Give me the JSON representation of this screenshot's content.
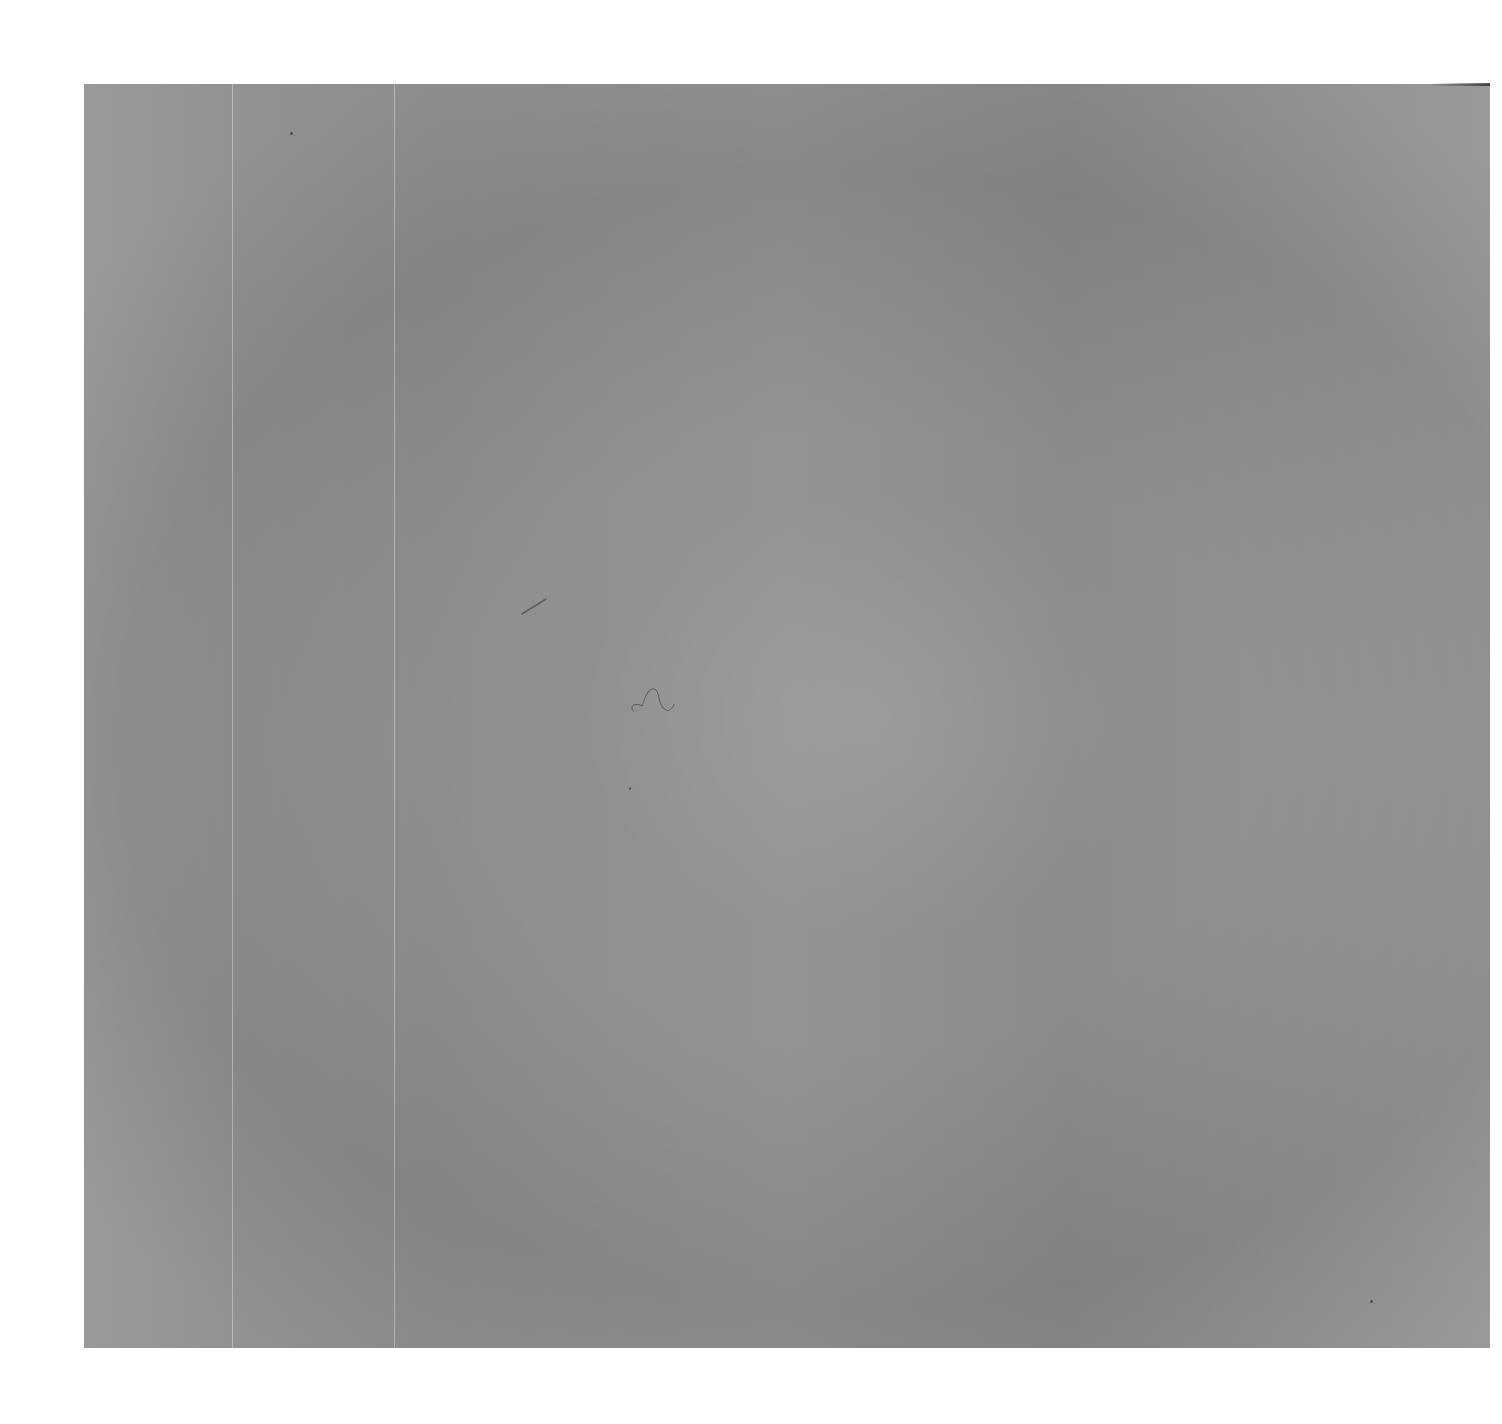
{
  "image": {
    "description": "Scanned blank sheet of textured gray paper/board on white background",
    "background_color": "#ffffff",
    "sheet_color": "#929292",
    "sheet": {
      "x": 84,
      "y": 84,
      "width": 1406,
      "height": 1264
    },
    "features": [
      {
        "type": "fold-line",
        "x": 232
      },
      {
        "type": "fold-line",
        "x": 394
      },
      {
        "type": "debris-streak",
        "x": 530,
        "y": 605
      },
      {
        "type": "hair",
        "x": 640,
        "y": 695
      },
      {
        "type": "speck",
        "x": 1370,
        "y": 1300
      }
    ],
    "text": []
  }
}
